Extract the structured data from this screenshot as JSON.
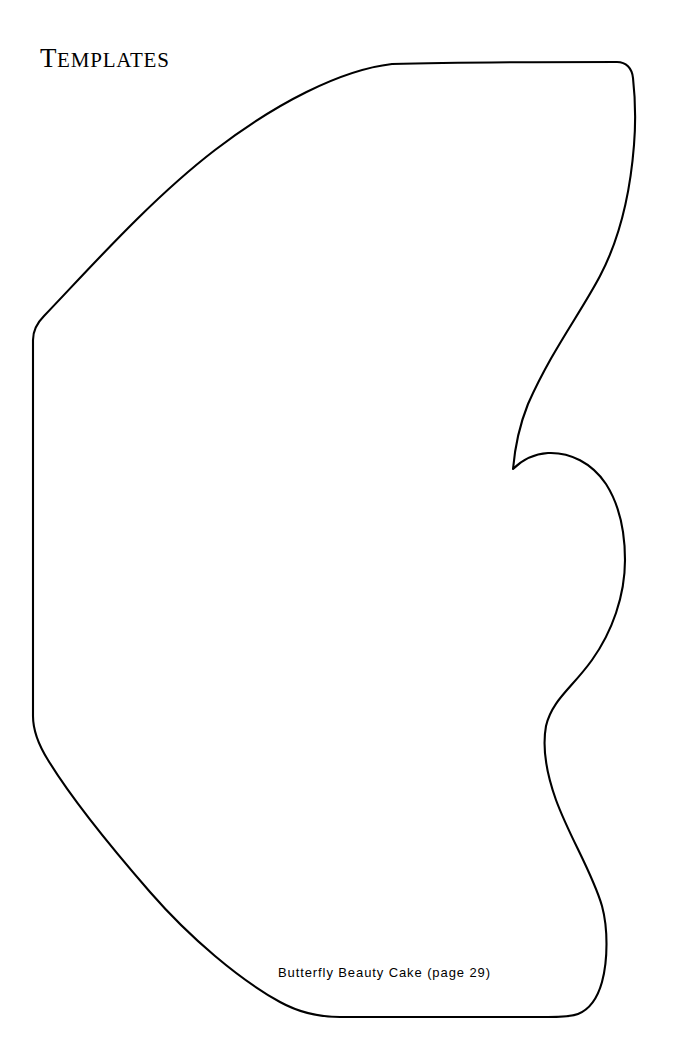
{
  "page": {
    "width": 678,
    "height": 1054,
    "background_color": "#ffffff",
    "ink_color": "#000000"
  },
  "heading": {
    "text": "TEMPLATES",
    "first_letter": "T",
    "remaining_letters": "EMPLATES",
    "style": "small-caps-serif"
  },
  "template_shape": {
    "name": "butterfly-wing-template-outline",
    "description": "Half butterfly wing cutting template outline",
    "stroke_color": "#000000",
    "fill_color": "#ffffff",
    "stroke_width": 2.1,
    "path": "M 33 340 C 33 332 36 324 44 316 C 90 268 150 200 215 150 C 275 104 340 70 392 64 C 460 62 560 62 617 62 C 626 62 632 68 633 78 C 635 96 636 120 634 145 C 630 196 620 238 600 276 C 580 314 552 350 528 404 C 520 424 515 446 513 469 C 522 460 534 454 548 453 C 570 452 592 463 606 484 C 620 506 625 534 625 560 C 625 596 612 632 592 660 C 572 688 552 700 546 726 C 542 748 546 772 556 800 C 570 838 592 872 602 906 C 608 928 608 960 602 982 C 597 1000 588 1010 578 1014 C 570 1017 560 1017 548 1017 C 480 1017 400 1017 340 1017 C 320 1017 300 1013 280 1002 C 240 980 190 938 150 892 C 110 846 70 796 48 760 C 38 744 33 730 33 716 Z",
    "features": {
      "top_edge_y": 63,
      "left_edge_x": 33,
      "bottom_edge_y": 1017,
      "cusp_point": [
        513,
        469
      ],
      "right_extent_x": 635
    }
  },
  "caption": {
    "text": "Butterfly Beauty Cake (page 29)",
    "recipe_name": "Butterfly Beauty Cake",
    "page_reference": "(page 29)",
    "page_number": "29"
  }
}
